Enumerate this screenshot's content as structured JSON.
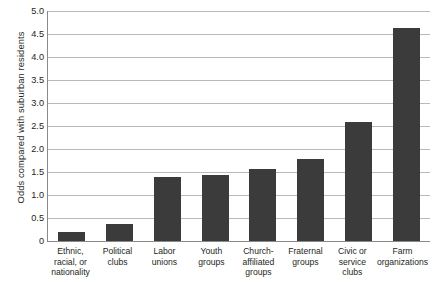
{
  "chart_data": {
    "type": "bar",
    "title": "",
    "xlabel": "",
    "ylabel": "Odds compared with suburban residents",
    "ylim": [
      0,
      5.0
    ],
    "ytick_labels": [
      "5.0",
      "4.5",
      "4.0",
      "3.5",
      "3.0",
      "2.5",
      "2.0",
      "1.5",
      "1.0",
      "0.5",
      "0"
    ],
    "ytick_values": [
      5.0,
      4.5,
      4.0,
      3.5,
      3.0,
      2.5,
      2.0,
      1.5,
      1.0,
      0.5,
      0
    ],
    "grid": "horizontal",
    "legend": "none",
    "bar_color": "#3b3b3b",
    "gridline_color": "#b9b9b9",
    "axis_color": "#8a8a8a",
    "categories": [
      "Ethnic,\nracial, or\nnationality",
      "Political\nclubs",
      "Labor\nunions",
      "Youth\ngroups",
      "Church-\naffiliated\ngroups",
      "Fraternal\ngroups",
      "Civic or\nservice\nclubs",
      "Farm\norganizations"
    ],
    "values": [
      0.19,
      0.38,
      1.4,
      1.44,
      1.57,
      1.78,
      2.58,
      4.62
    ]
  }
}
